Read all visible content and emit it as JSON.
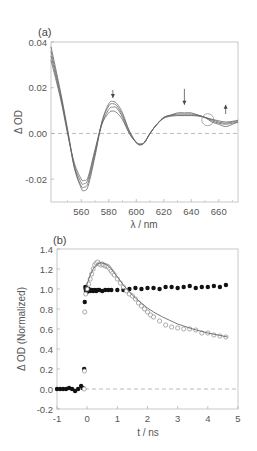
{
  "chart_data": [
    {
      "type": "line",
      "panel_label": "(a)",
      "title": "",
      "xlabel": "λ / nm",
      "ylabel": "Δ OD",
      "xlim": [
        538,
        674
      ],
      "ylim": [
        -0.03,
        0.04
      ],
      "xticks": [
        560,
        580,
        600,
        620,
        640,
        660
      ],
      "yticks": [
        -0.02,
        0.0,
        0.02,
        0.04
      ],
      "ytick_labels": [
        "-0.02",
        "0.00",
        "0.02",
        "0.04"
      ],
      "zero_line": "dashed",
      "grid": false,
      "x": [
        538,
        545,
        550,
        555,
        560,
        562,
        565,
        570,
        575,
        580,
        583,
        586,
        590,
        595,
        600,
        603,
        606,
        610,
        615,
        620,
        625,
        630,
        635,
        640,
        645,
        650,
        655,
        660,
        665,
        670,
        674
      ],
      "series": [
        {
          "name": "spectrum 1",
          "values": [
            0.038,
            0.018,
            0.002,
            -0.015,
            -0.024,
            -0.025,
            -0.023,
            -0.01,
            0.005,
            0.013,
            0.014,
            0.013,
            0.009,
            0.001,
            -0.004,
            -0.005,
            -0.004,
            0.0,
            0.004,
            0.007,
            0.008,
            0.009,
            0.009,
            0.009,
            0.008,
            0.007,
            0.005,
            0.004,
            0.003,
            0.004,
            0.005
          ]
        },
        {
          "name": "spectrum 2",
          "values": [
            0.036,
            0.017,
            0.001,
            -0.015,
            -0.023,
            -0.0235,
            -0.0215,
            -0.009,
            0.005,
            0.012,
            0.013,
            0.012,
            0.008,
            0.001,
            -0.004,
            -0.005,
            -0.004,
            0.0,
            0.004,
            0.007,
            0.008,
            0.0085,
            0.0085,
            0.0085,
            0.008,
            0.007,
            0.0055,
            0.0045,
            0.004,
            0.0045,
            0.005
          ]
        },
        {
          "name": "spectrum 3",
          "values": [
            0.034,
            0.016,
            0.001,
            -0.014,
            -0.0215,
            -0.022,
            -0.02,
            -0.008,
            0.004,
            0.0105,
            0.0115,
            0.011,
            0.007,
            0.0,
            -0.004,
            -0.0048,
            -0.004,
            0.0,
            0.004,
            0.0068,
            0.0078,
            0.008,
            0.008,
            0.008,
            0.0078,
            0.007,
            0.006,
            0.005,
            0.0045,
            0.005,
            0.0055
          ]
        },
        {
          "name": "spectrum 4",
          "values": [
            0.032,
            0.015,
            0.0,
            -0.013,
            -0.02,
            -0.0205,
            -0.019,
            -0.007,
            0.004,
            0.009,
            0.0098,
            0.009,
            0.006,
            0.0,
            -0.0038,
            -0.0045,
            -0.0038,
            0.0,
            0.004,
            0.0066,
            0.0075,
            0.0078,
            0.0078,
            0.0078,
            0.0076,
            0.007,
            0.0062,
            0.0055,
            0.005,
            0.0053,
            0.0058
          ]
        }
      ],
      "annotations": [
        {
          "type": "arrow-down",
          "x": 583,
          "y_from": 0.019,
          "y_to": 0.0155
        },
        {
          "type": "arrow-down",
          "x": 635,
          "y_from": 0.0195,
          "y_to": 0.0125
        },
        {
          "type": "arrow-up",
          "x": 665,
          "y_from": 0.0085,
          "y_to": 0.0125
        },
        {
          "type": "circle",
          "x": 652,
          "y": 0.006,
          "label": "isosbestic point"
        }
      ]
    },
    {
      "type": "scatter",
      "panel_label": "(b)",
      "title": "",
      "xlabel": "t / ns",
      "ylabel": "Δ OD  (Normalized)",
      "xlim": [
        -1,
        5
      ],
      "ylim": [
        -0.2,
        1.4
      ],
      "xticks": [
        -1,
        0,
        1,
        2,
        3,
        4,
        5
      ],
      "xtick_labels": [
        "-1",
        "0",
        "1",
        "2",
        "3",
        "4",
        "5"
      ],
      "yticks": [
        -0.2,
        0.0,
        0.2,
        0.4,
        0.6,
        0.8,
        1.0,
        1.2,
        1.4
      ],
      "ytick_labels": [
        "-0.2",
        "0.0",
        "0.2",
        "0.4",
        "0.6",
        "0.8",
        "1.0",
        "1.2",
        "1.4"
      ],
      "zero_line": "dashed",
      "grid": false,
      "series": [
        {
          "name": "filled circles",
          "marker": "filled-circle",
          "x": [
            -1.0,
            -0.9,
            -0.8,
            -0.7,
            -0.6,
            -0.5,
            -0.4,
            -0.3,
            -0.2,
            -0.15,
            -0.1,
            -0.08,
            -0.06,
            -0.05,
            -0.04,
            -0.03,
            -0.02,
            -0.01,
            0.0,
            0.02,
            0.05,
            0.1,
            0.15,
            0.2,
            0.25,
            0.3,
            0.35,
            0.4,
            0.5,
            0.6,
            0.7,
            0.8,
            1.0,
            1.2,
            1.4,
            1.6,
            1.8,
            2.0,
            2.2,
            2.4,
            2.6,
            2.8,
            3.0,
            3.2,
            3.4,
            3.6,
            3.8,
            4.0,
            4.2,
            4.4,
            4.6
          ],
          "y": [
            0.0,
            0.0,
            0.0,
            0.0,
            0.01,
            0.0,
            -0.02,
            0.0,
            0.03,
            0.01,
            0.2,
            0.87,
            1.02,
            1.0,
            0.98,
            1.01,
            1.0,
            0.97,
            0.99,
            0.98,
            1.0,
            0.98,
            0.99,
            0.98,
            0.99,
            0.98,
            0.99,
            0.99,
            0.98,
            0.99,
            0.99,
            0.99,
            0.99,
            0.99,
            1.0,
            1.01,
            1.0,
            1.01,
            1.01,
            1.0,
            1.02,
            1.02,
            1.01,
            1.02,
            1.03,
            1.01,
            1.02,
            1.02,
            1.03,
            1.02,
            1.04
          ]
        },
        {
          "name": "open circles",
          "marker": "open-circle",
          "x": [
            -0.1,
            -0.09,
            -0.08,
            -0.05,
            0.0,
            0.05,
            0.1,
            0.15,
            0.2,
            0.25,
            0.3,
            0.35,
            0.4,
            0.45,
            0.5,
            0.55,
            0.6,
            0.65,
            0.7,
            0.75,
            0.8,
            0.85,
            0.9,
            1.0,
            1.1,
            1.2,
            1.3,
            1.4,
            1.5,
            1.6,
            1.7,
            1.8,
            1.9,
            2.0,
            2.1,
            2.2,
            2.4,
            2.6,
            2.8,
            3.0,
            3.2,
            3.4,
            3.6,
            3.8,
            4.0,
            4.2,
            4.4,
            4.6
          ],
          "y": [
            0.0,
            0.18,
            0.77,
            0.95,
            1.0,
            1.05,
            1.1,
            1.15,
            1.2,
            1.24,
            1.26,
            1.27,
            1.25,
            1.24,
            1.25,
            1.24,
            1.23,
            1.23,
            1.22,
            1.2,
            1.18,
            1.16,
            1.14,
            1.1,
            1.06,
            1.02,
            0.98,
            0.95,
            0.93,
            0.9,
            0.86,
            0.83,
            0.8,
            0.77,
            0.74,
            0.72,
            0.68,
            0.64,
            0.62,
            0.61,
            0.6,
            0.6,
            0.59,
            0.56,
            0.56,
            0.54,
            0.53,
            0.52
          ]
        },
        {
          "name": "fit",
          "marker": "line",
          "x": [
            -0.08,
            0.0,
            0.1,
            0.2,
            0.3,
            0.4,
            0.5,
            0.6,
            0.7,
            0.8,
            1.0,
            1.2,
            1.4,
            1.6,
            1.8,
            2.0,
            2.2,
            2.5,
            3.0,
            3.5,
            4.0,
            4.5,
            4.65
          ],
          "y": [
            0.98,
            1.05,
            1.14,
            1.2,
            1.24,
            1.26,
            1.26,
            1.25,
            1.23,
            1.2,
            1.12,
            1.04,
            0.97,
            0.91,
            0.86,
            0.81,
            0.77,
            0.72,
            0.65,
            0.6,
            0.56,
            0.53,
            0.52
          ]
        }
      ]
    }
  ],
  "caption_text": ""
}
